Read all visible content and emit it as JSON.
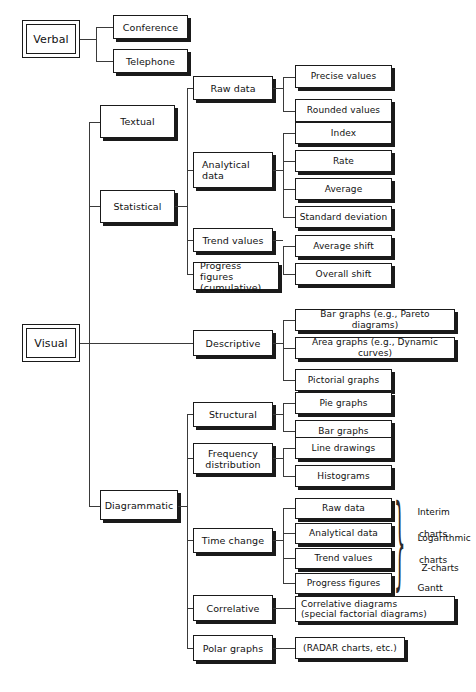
{
  "diagram": {
    "roots": [
      {
        "id": "verbal",
        "label": "Verbal"
      },
      {
        "id": "visual",
        "label": "Visual"
      }
    ],
    "nodes": {
      "conference": "Conference",
      "telephone": "Telephone",
      "textual": "Textual",
      "statistical": "Statistical",
      "raw_data": "Raw data",
      "analytical_data": "Analytical\ndata",
      "trend_values": "Trend values",
      "progress_figures_cumulative": "Progress figures\n(cumulative)",
      "precise_values": "Precise values",
      "rounded_values": "Rounded values",
      "index": "Index",
      "rate": "Rate",
      "average": "Average",
      "standard_deviation": "Standard deviation",
      "average_shift": "Average shift",
      "overall_shift": "Overall shift",
      "descriptive": "Descriptive",
      "bar_graphs_pareto": "Bar graphs (e.g., Pareto diagrams)",
      "area_graphs_dynamic": "Area graphs (e.g., Dynamic curves)",
      "pictorial_graphs": "Pictorial graphs",
      "diagrammatic": "Diagrammatic",
      "structural": "Structural",
      "pie_graphs": "Pie graphs",
      "bar_graphs": "Bar graphs",
      "frequency_distribution": "Frequency\ndistribution",
      "line_drawings": "Line drawings",
      "histograms": "Histograms",
      "time_change": "Time change",
      "tc_raw_data": "Raw data",
      "tc_analytical_data": "Analytical data",
      "tc_trend_values": "Trend values",
      "tc_progress_figures": "Progress figures",
      "correlative": "Correlative",
      "correlative_diagrams": "Correlative diagrams\n(special factorial diagrams)",
      "polar_graphs": "Polar graphs",
      "radar_charts": "(RADAR charts, etc.)"
    },
    "brace_labels": [
      {
        "line1": "Interim",
        "line2": "charts"
      },
      {
        "line1": "Logarithmic",
        "line2": "charts"
      },
      {
        "line1": "Z-charts",
        "line2": ""
      },
      {
        "line1": "Gantt",
        "line2": "charts"
      }
    ],
    "colors": {
      "background": "#ffffff",
      "box_border": "#1a1a1a",
      "box_fill": "#ffffff",
      "shadow": "#1a1a1a",
      "connector": "#3a3a3a",
      "text": "#111111"
    }
  }
}
